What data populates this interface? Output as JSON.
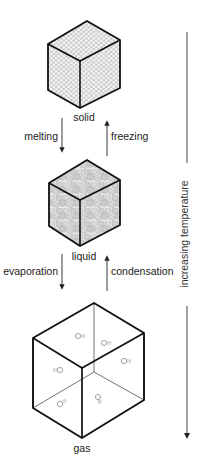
{
  "diagram": {
    "states": [
      {
        "id": "solid",
        "label": "solid"
      },
      {
        "id": "liquid",
        "label": "liquid"
      },
      {
        "id": "gas",
        "label": "gas"
      }
    ],
    "transitions": [
      {
        "from": "solid",
        "to": "liquid",
        "label": "melting",
        "direction": "down"
      },
      {
        "from": "liquid",
        "to": "solid",
        "label": "freezing",
        "direction": "up"
      },
      {
        "from": "liquid",
        "to": "gas",
        "label": "evaporation",
        "direction": "down"
      },
      {
        "from": "gas",
        "to": "liquid",
        "label": "condensation",
        "direction": "up"
      }
    ],
    "axis": {
      "label": "increasing temperature",
      "direction": "down"
    }
  },
  "colors": {
    "line": "#111111",
    "particle_fill": "#f2f2f2",
    "particle_stroke": "#9a9a9a",
    "face_bg": "#d9d9d9",
    "axis": "#444444"
  }
}
